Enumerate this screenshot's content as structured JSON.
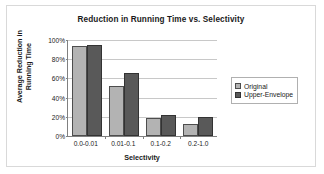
{
  "chart_data": {
    "type": "bar",
    "title": "Reduction in Running Time vs. Selectivity",
    "xlabel": "Selectivity",
    "ylabel": "Average Reduction in Running Time",
    "ylabel_line1": "Average Reduction in",
    "ylabel_line2": "Running Time",
    "categories": [
      "0.0-0.01",
      "0.01-0.1",
      "0.1-0.2",
      "0.2-1.0"
    ],
    "series": [
      {
        "name": "Original",
        "values": [
          94,
          52,
          19,
          12
        ],
        "color": "#b3b3b3"
      },
      {
        "name": "Upper-Envelope",
        "values": [
          95,
          66,
          22,
          20
        ],
        "color": "#595959"
      }
    ],
    "ylim": [
      0,
      100
    ],
    "ytick_labels": [
      "100%",
      "80%",
      "60%",
      "40%",
      "20%",
      "0%"
    ],
    "ytick_values": [
      100,
      80,
      60,
      40,
      20,
      0
    ],
    "grid": true,
    "legend_position": "right",
    "value_suffix": "%"
  }
}
